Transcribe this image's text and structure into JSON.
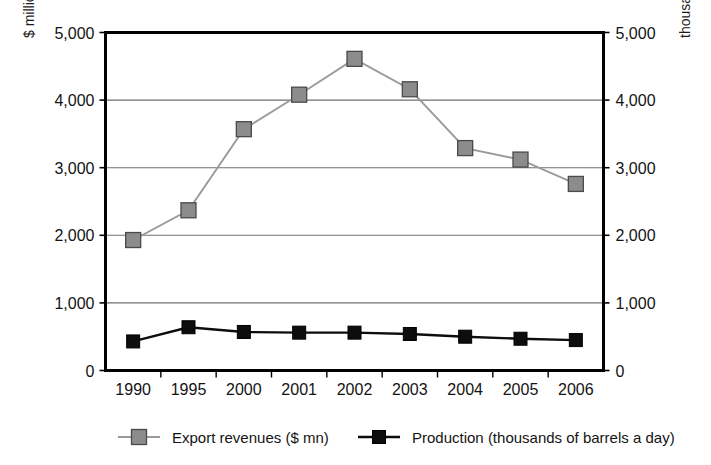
{
  "chart_data": {
    "type": "line",
    "title": "",
    "subtitle": "",
    "xlabel": "",
    "ylabel": "$ millions",
    "y2label": "thousands of barrels a day",
    "categories": [
      "1990",
      "1995",
      "2000",
      "2001",
      "2002",
      "2003",
      "2004",
      "2005",
      "2006"
    ],
    "ylim": [
      0,
      5000
    ],
    "y2lim": [
      0,
      5000
    ],
    "yticks": [
      "0",
      "1,000",
      "2,000",
      "3,000",
      "4,000",
      "5,000"
    ],
    "ytick_values": [
      0,
      1000,
      2000,
      3000,
      4000,
      5000
    ],
    "y2ticks": [
      "0",
      "1,000",
      "2,000",
      "3,000",
      "4,000",
      "5,000"
    ],
    "y2tick_values": [
      0,
      1000,
      2000,
      3000,
      4000,
      5000
    ],
    "grid": true,
    "grid_axis": "y",
    "legend_position": "bottom",
    "series": [
      {
        "name": "Export revenues ($ mn)",
        "axis": "left",
        "marker": "square",
        "marker_color": "#8c8c8c",
        "line_color": "#9a9a9a",
        "values": [
          1930,
          2370,
          3570,
          4080,
          4610,
          4160,
          3290,
          3120,
          2760
        ]
      },
      {
        "name": "Production (thousands of barrels a day)",
        "axis": "right",
        "marker": "square",
        "marker_color": "#0d0d0d",
        "line_color": "#0d0d0d",
        "values": [
          430,
          640,
          570,
          560,
          560,
          540,
          500,
          470,
          450
        ]
      }
    ]
  },
  "legend": {
    "items": [
      {
        "label": "Export revenues ($ mn)",
        "swatch": "gray-square-marker"
      },
      {
        "label": "Production (thousands of barrels a day)",
        "swatch": "black-square-marker"
      }
    ]
  },
  "colors": {
    "export_marker": "#8c8c8c",
    "export_line": "#9a9a9a",
    "production_marker": "#0d0d0d",
    "production_line": "#0d0d0d",
    "grid": "#6f6f6f",
    "axis": "#000000",
    "background": "#ffffff"
  }
}
